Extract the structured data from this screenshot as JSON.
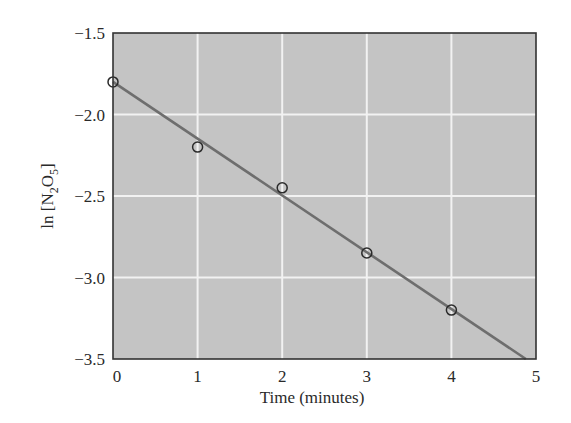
{
  "chart_data": {
    "type": "scatter",
    "title": "",
    "xlabel": "Time (minutes)",
    "ylabel": "ln [N2O5]",
    "ylabel_parts": {
      "prefix": "ln [N",
      "sub1": "2",
      "mid": "O",
      "sub2": "5",
      "suffix": "]"
    },
    "xlim": [
      0,
      5
    ],
    "ylim": [
      -3.5,
      -1.5
    ],
    "x_ticks": [
      0,
      1,
      2,
      3,
      4,
      5
    ],
    "x_tick_labels": [
      "0",
      "1",
      "2",
      "3",
      "4",
      "5"
    ],
    "y_ticks": [
      -1.5,
      -2.0,
      -2.5,
      -3.0,
      -3.5
    ],
    "y_tick_labels": [
      "−1.5",
      "−2.0",
      "−2.5",
      "−3.0",
      "−3.5"
    ],
    "grid": true,
    "series": [
      {
        "name": "data points",
        "type": "scatter",
        "marker": "open-circle",
        "x": [
          0,
          1,
          2,
          3,
          4
        ],
        "y": [
          -1.8,
          -2.2,
          -2.45,
          -2.85,
          -3.2
        ]
      },
      {
        "name": "linear fit",
        "type": "line",
        "x": [
          0,
          4.88
        ],
        "y": [
          -1.8,
          -3.5
        ]
      }
    ],
    "colors": {
      "plot_background": "#c4c4c4",
      "grid": "#f2f2f2",
      "line": "#6e6e6e",
      "marker": "#2a2a2a",
      "frame": "#333333"
    }
  }
}
